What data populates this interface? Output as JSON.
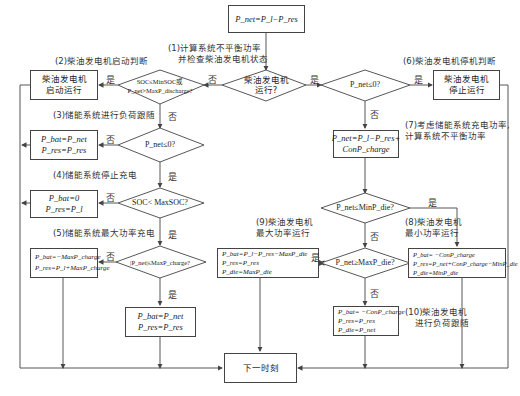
{
  "colors": {
    "line": "#444444",
    "text": "#333333",
    "background": "#ffffff"
  },
  "nodes": {
    "start_box": {
      "text": "P_net=P_l−P_res"
    },
    "d_diesel_running": {
      "line1": "柴油发电机",
      "line2": "运行?"
    },
    "d_start_judge": {
      "line1": "SOC≤MinSOC或",
      "line2": "P_net>MaxP_discharge?"
    },
    "box_diesel_start": {
      "line1": "柴油发电机",
      "line2": "启动运行"
    },
    "d_pnet_le0_right": {
      "text": "P_net≤0?"
    },
    "box_diesel_stop": {
      "line1": "柴油发电机",
      "line2": "停止运行"
    },
    "d_pnet_le0_left": {
      "text": "P_net≤0?"
    },
    "box_load_follow": {
      "line1": "P_bat=P_net",
      "line2": "P_res=P_res"
    },
    "d_soc_lt_max": {
      "text": "SOC< MaxSOC?"
    },
    "box_stop_charge": {
      "line1": "P_bat=0",
      "line2": "P_res=P_l"
    },
    "d_abs_pnet": {
      "text": "|P_net|≤MaxP_charge?"
    },
    "box_max_charge": {
      "line1": "P_bat=−MaxP_charge",
      "line2": "P_res=P_l+MaxP_charge"
    },
    "box_charge_normal": {
      "line1": "P_bat=P_net",
      "line2": "P_res=P_res"
    },
    "box_next": {
      "text": "下一时刻"
    },
    "box_recalc": {
      "line1": "P_net=P_l−P_res+",
      "line2": "ConP_charge"
    },
    "d_min_die": {
      "text": "P_net≤MinP_die?"
    },
    "d_max_die": {
      "text": "P_net≥MaxP_die?"
    },
    "box_max_power": {
      "line1": "P_bat=P_l−P_res−MaxP_die",
      "line2": "P_res=P_res",
      "line3": "P_die=MaxP_die"
    },
    "box_min_power": {
      "line1": "P_bat= −ConP_charge",
      "line2": "P_res=P_net+ConP_charge−MinP_die",
      "line3": "P_die=MinP_die"
    },
    "box_load_track": {
      "line1": "P_bat= −ConP_charge",
      "line2": "P_res=P_res",
      "line3": "P_die=P_net"
    }
  },
  "annotations": {
    "a1": {
      "line1": "(1)计算系统不平衡功率",
      "line2": "并检查柴油发电机状态"
    },
    "a2": "(2)柴油发电机启动判断",
    "a3": "(3)储能系统进行负荷跟随",
    "a4": "(4)储能系统停止充电",
    "a5": "(5)储能系统最大功率充电",
    "a6": "(6)柴油发电机停机判断",
    "a7": {
      "line1": "(7)考虑储能系统充电功率,",
      "line2": "计算系统不平衡功率"
    },
    "a8": {
      "line1": "(8)柴油发电机",
      "line2": "最小功率运行"
    },
    "a9": {
      "line1": "(9)柴油发电机",
      "line2": "最大功率运行"
    },
    "a10": {
      "line1": "(10)柴油发电机",
      "line2": "进行负荷跟随"
    }
  },
  "edge_labels": {
    "yes": "是",
    "no": "否"
  }
}
